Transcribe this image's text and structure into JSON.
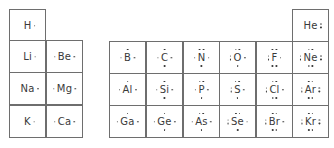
{
  "colors": {
    "border": "#6e6e6e",
    "text": "#3a3a3a",
    "background": "#ffffff"
  },
  "cells": [
    {
      "symbol": "H",
      "x": 9,
      "y": 9,
      "dots": {
        "top": 0,
        "bottom": 0,
        "left": 0,
        "right": 1
      }
    },
    {
      "symbol": "Li",
      "x": 9,
      "y": 40,
      "dots": {
        "top": 0,
        "bottom": 0,
        "left": 0,
        "right": 1
      }
    },
    {
      "symbol": "Be",
      "x": 46,
      "y": 40,
      "dots": {
        "top": 0,
        "bottom": 0,
        "left": 1,
        "right": 1
      }
    },
    {
      "symbol": "Na",
      "x": 9,
      "y": 72,
      "dots": {
        "top": 0,
        "bottom": 0,
        "left": 0,
        "right": 1
      }
    },
    {
      "symbol": "Mg",
      "x": 46,
      "y": 72,
      "dots": {
        "top": 0,
        "bottom": 0,
        "left": 1,
        "right": 1
      }
    },
    {
      "symbol": "K",
      "x": 9,
      "y": 105,
      "dots": {
        "top": 0,
        "bottom": 0,
        "left": 0,
        "right": 1
      }
    },
    {
      "symbol": "Ca",
      "x": 46,
      "y": 105,
      "dots": {
        "top": 0,
        "bottom": 0,
        "left": 1,
        "right": 1
      }
    },
    {
      "symbol": "He",
      "x": 292,
      "y": 9,
      "dots": {
        "top": 0,
        "bottom": 0,
        "left": 0,
        "right": 2
      }
    },
    {
      "symbol": "B",
      "x": 109,
      "y": 41,
      "dots": {
        "top": 1,
        "bottom": 0,
        "left": 1,
        "right": 1
      }
    },
    {
      "symbol": "C",
      "x": 146,
      "y": 41,
      "dots": {
        "top": 1,
        "bottom": 1,
        "left": 1,
        "right": 1
      }
    },
    {
      "symbol": "N",
      "x": 183,
      "y": 41,
      "dots": {
        "top": 2,
        "bottom": 1,
        "left": 1,
        "right": 1
      }
    },
    {
      "symbol": "O",
      "x": 219,
      "y": 41,
      "dots": {
        "top": 2,
        "bottom": 1,
        "left": 2,
        "right": 1
      }
    },
    {
      "symbol": "F",
      "x": 256,
      "y": 41,
      "dots": {
        "top": 2,
        "bottom": 2,
        "left": 2,
        "right": 1
      }
    },
    {
      "symbol": "Ne",
      "x": 292,
      "y": 41,
      "dots": {
        "top": 2,
        "bottom": 2,
        "left": 2,
        "right": 2
      }
    },
    {
      "symbol": "Al",
      "x": 109,
      "y": 73,
      "dots": {
        "top": 1,
        "bottom": 0,
        "left": 1,
        "right": 1
      }
    },
    {
      "symbol": "Si",
      "x": 146,
      "y": 73,
      "dots": {
        "top": 1,
        "bottom": 1,
        "left": 1,
        "right": 1
      }
    },
    {
      "symbol": "P",
      "x": 183,
      "y": 73,
      "dots": {
        "top": 2,
        "bottom": 1,
        "left": 1,
        "right": 1
      }
    },
    {
      "symbol": "S",
      "x": 219,
      "y": 73,
      "dots": {
        "top": 2,
        "bottom": 1,
        "left": 2,
        "right": 1
      }
    },
    {
      "symbol": "Cl",
      "x": 256,
      "y": 73,
      "dots": {
        "top": 2,
        "bottom": 2,
        "left": 2,
        "right": 1
      }
    },
    {
      "symbol": "Ar",
      "x": 292,
      "y": 73,
      "dots": {
        "top": 2,
        "bottom": 2,
        "left": 2,
        "right": 2
      }
    },
    {
      "symbol": "Ga",
      "x": 109,
      "y": 105,
      "dots": {
        "top": 1,
        "bottom": 0,
        "left": 1,
        "right": 1
      }
    },
    {
      "symbol": "Ge",
      "x": 146,
      "y": 105,
      "dots": {
        "top": 1,
        "bottom": 1,
        "left": 1,
        "right": 1
      }
    },
    {
      "symbol": "As",
      "x": 183,
      "y": 105,
      "dots": {
        "top": 2,
        "bottom": 1,
        "left": 1,
        "right": 1
      }
    },
    {
      "symbol": "Se",
      "x": 219,
      "y": 105,
      "dots": {
        "top": 2,
        "bottom": 1,
        "left": 2,
        "right": 1
      }
    },
    {
      "symbol": "Br",
      "x": 256,
      "y": 105,
      "dots": {
        "top": 2,
        "bottom": 2,
        "left": 2,
        "right": 1
      }
    },
    {
      "symbol": "Kr",
      "x": 292,
      "y": 105,
      "dots": {
        "top": 2,
        "bottom": 2,
        "left": 2,
        "right": 2
      }
    }
  ],
  "cell_size": {
    "w": 37,
    "h": 33
  }
}
